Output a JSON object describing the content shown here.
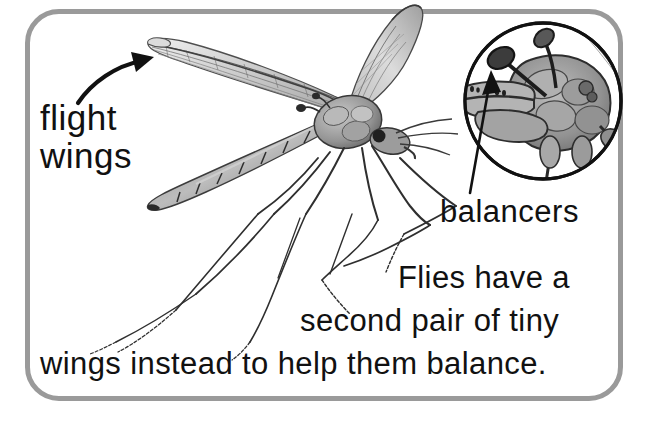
{
  "page": {
    "title": "Flies have a second pair of tiny wings instead to help them balance.",
    "background_color": "#ffffff",
    "border_color": "#9a9a9a",
    "text_color": "#111111"
  },
  "labels": {
    "flight": "flight",
    "wings": "wings",
    "balancers": "balancers"
  },
  "caption": {
    "line1": "Flies have a",
    "line2": "second pair of tiny",
    "line3": "wings instead to help them balance."
  },
  "illustration": {
    "subject": "crane-fly",
    "inset": {
      "shape": "circle",
      "subject": "fly-thorax-haltere-detail"
    },
    "arrows": [
      {
        "name": "flight-wings-arrow",
        "style": "curved",
        "points_to": "forewing"
      },
      {
        "name": "balancers-arrow",
        "style": "straight",
        "points_to": "haltere-knob"
      }
    ]
  }
}
